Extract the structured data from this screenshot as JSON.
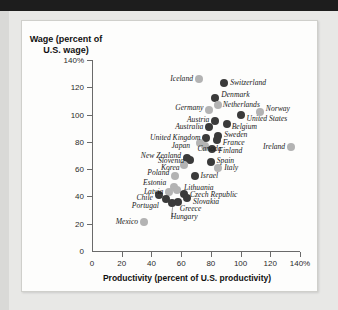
{
  "chart_data": {
    "type": "scatter",
    "title": "",
    "xlabel": "Productivity (percent of U.S. productivity)",
    "ylabel": "Wage (percent of U.S. wage)",
    "xlim": [
      0,
      140
    ],
    "ylim": [
      0,
      140
    ],
    "xticks": [
      "0",
      "20",
      "40",
      "60",
      "80",
      "100",
      "120",
      "140%"
    ],
    "xtick_values": [
      0,
      20,
      40,
      60,
      80,
      100,
      120,
      140
    ],
    "yticks": [
      "0",
      "20",
      "40",
      "60",
      "80",
      "100",
      "120",
      "140%"
    ],
    "ytick_values": [
      0,
      20,
      40,
      60,
      80,
      100,
      120,
      140
    ],
    "grid": false,
    "legend": "none",
    "marker_colors": {
      "dark": "#3a3a3a",
      "light": "#b3b3b3"
    },
    "points": [
      {
        "label": "Iceland",
        "x": 72,
        "y": 126,
        "color": "light",
        "lx": 68,
        "ly": 126,
        "side": "r"
      },
      {
        "label": "Switzerland",
        "x": 89,
        "y": 123,
        "color": "dark",
        "lx": 93,
        "ly": 123,
        "side": "l"
      },
      {
        "label": "Denmark",
        "x": 83,
        "y": 112,
        "color": "dark",
        "lx": 87,
        "ly": 114,
        "side": "l"
      },
      {
        "label": "Netherlands",
        "x": 85,
        "y": 107,
        "color": "light",
        "lx": 88,
        "ly": 107,
        "side": "l"
      },
      {
        "label": "Germany",
        "x": 79,
        "y": 103,
        "color": "light",
        "lx": 75,
        "ly": 105,
        "side": "r"
      },
      {
        "label": "Norway",
        "x": 113,
        "y": 102,
        "color": "light",
        "lx": 117,
        "ly": 104,
        "side": "l"
      },
      {
        "label": "United States",
        "x": 100,
        "y": 100,
        "color": "dark",
        "lx": 104,
        "ly": 97,
        "side": "l"
      },
      {
        "label": "Austria",
        "x": 83,
        "y": 95,
        "color": "dark",
        "lx": 79,
        "ly": 96,
        "side": "r"
      },
      {
        "label": "Belgium",
        "x": 91,
        "y": 93,
        "color": "dark",
        "lx": 94,
        "ly": 91,
        "side": "l"
      },
      {
        "label": "Australia",
        "x": 79,
        "y": 91,
        "color": "dark",
        "lx": 75,
        "ly": 91,
        "side": "r"
      },
      {
        "label": "Sweden",
        "x": 85,
        "y": 84,
        "color": "dark",
        "lx": 89,
        "ly": 85,
        "side": "l"
      },
      {
        "label": "United Kingdom",
        "x": 77,
        "y": 83,
        "color": "dark",
        "lx": 73,
        "ly": 83,
        "side": "r"
      },
      {
        "label": "France",
        "x": 84,
        "y": 81,
        "color": "dark",
        "lx": 88,
        "ly": 79,
        "side": "l"
      },
      {
        "label": "Japan",
        "x": 73,
        "y": 79,
        "color": "light",
        "lx": 66,
        "ly": 77,
        "side": "r"
      },
      {
        "label": "Canada",
        "x": 76,
        "y": 77,
        "color": "light",
        "lx": 71,
        "ly": 75,
        "side": "l"
      },
      {
        "label": "Ireland",
        "x": 134,
        "y": 76,
        "color": "light",
        "lx": 130,
        "ly": 76,
        "side": "r"
      },
      {
        "label": "Finland",
        "x": 81,
        "y": 75,
        "color": "dark",
        "lx": 85,
        "ly": 73,
        "side": "l"
      },
      {
        "label": "New Zealand",
        "x": 64,
        "y": 68,
        "color": "dark",
        "lx": 60,
        "ly": 70,
        "side": "r"
      },
      {
        "label": "Slovenia",
        "x": 66,
        "y": 67,
        "color": "dark",
        "lx": 62,
        "ly": 66,
        "side": "r"
      },
      {
        "label": "Spain",
        "x": 80,
        "y": 65,
        "color": "dark",
        "lx": 84,
        "ly": 66,
        "side": "l"
      },
      {
        "label": "Korea",
        "x": 62,
        "y": 63,
        "color": "light",
        "lx": 59,
        "ly": 61,
        "side": "r"
      },
      {
        "label": "Italy",
        "x": 85,
        "y": 61,
        "color": "light",
        "lx": 89,
        "ly": 61,
        "side": "l"
      },
      {
        "label": "Poland",
        "x": 56,
        "y": 55,
        "color": "light",
        "lx": 52,
        "ly": 57,
        "side": "r"
      },
      {
        "label": "Israel",
        "x": 69,
        "y": 55,
        "color": "dark",
        "lx": 73,
        "ly": 55,
        "side": "l"
      },
      {
        "label": "Estonia",
        "x": 55,
        "y": 47,
        "color": "light",
        "lx": 50,
        "ly": 50,
        "side": "r"
      },
      {
        "label": "Lithuania",
        "x": 57,
        "y": 45,
        "color": "light",
        "lx": 62,
        "ly": 46,
        "side": "l"
      },
      {
        "label": "Latvia",
        "x": 52,
        "y": 43,
        "color": "light",
        "lx": 48,
        "ly": 43,
        "side": "r"
      },
      {
        "label": "Czech Republic",
        "x": 62,
        "y": 42,
        "color": "dark",
        "lx": 66,
        "ly": 41,
        "side": "l"
      },
      {
        "label": "Chile",
        "x": 45,
        "y": 41,
        "color": "dark",
        "lx": 41,
        "ly": 39,
        "side": "r"
      },
      {
        "label": "Slovakia",
        "x": 64,
        "y": 39,
        "color": "dark",
        "lx": 68,
        "ly": 36,
        "side": "l"
      },
      {
        "label": "Portugal",
        "x": 50,
        "y": 38,
        "color": "dark",
        "lx": 45,
        "ly": 33,
        "side": "r"
      },
      {
        "label": "Greece",
        "x": 58,
        "y": 36,
        "color": "dark",
        "lx": 59,
        "ly": 31,
        "side": "l"
      },
      {
        "label": "Hungary",
        "x": 54,
        "y": 35,
        "color": "dark",
        "lx": 53,
        "ly": 25,
        "side": "l"
      },
      {
        "label": "Mexico",
        "x": 35,
        "y": 21,
        "color": "light",
        "lx": 31,
        "ly": 21,
        "side": "r"
      }
    ]
  }
}
